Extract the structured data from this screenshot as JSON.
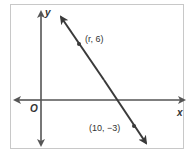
{
  "figure": {
    "axes": {
      "x_label": "x",
      "y_label": "y",
      "origin_label": "O"
    },
    "line": {
      "description": "line through two points with arrows at both ends"
    },
    "points": [
      {
        "label": "(r, 6)",
        "x": "r",
        "y": 6
      },
      {
        "label": "(10, −3)",
        "x": 10,
        "y": -3
      }
    ],
    "colors": {
      "border": "#c8c8c8",
      "axis": "#555555",
      "line": "#3a3a3a",
      "text": "#333333"
    }
  }
}
